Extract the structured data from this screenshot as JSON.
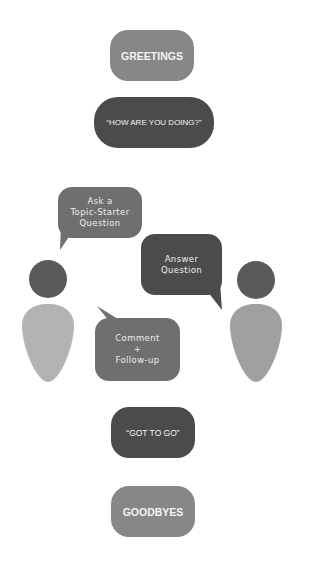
{
  "diagram": {
    "steps": {
      "greetings": "GREETINGS",
      "how_are_you": "“HOW ARE YOU DOING?”",
      "got_to_go": "“GOT TO GO”",
      "goodbyes": "GOODBYES"
    },
    "bubbles": {
      "ask": "Ask a\nTopic-Starter\nQuestion",
      "answer": "Answer\nQuestion",
      "comment": "Comment\n+\nFollow-up"
    },
    "colors": {
      "light_gray": "#878787",
      "dark_gray": "#4b4b4b",
      "mid_gray": "#6f6f6f",
      "head": "#5a5a5a",
      "body_left": "#b3b3b3",
      "body_right": "#a0a0a0"
    }
  }
}
